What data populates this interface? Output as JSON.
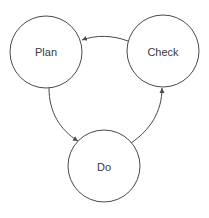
{
  "diagram": {
    "title": "",
    "nodes": [
      {
        "id": "plan",
        "label": "Plan"
      },
      {
        "id": "check",
        "label": "Check"
      },
      {
        "id": "do",
        "label": "Do"
      }
    ],
    "edges": [
      {
        "from": "plan",
        "to": "do"
      },
      {
        "from": "do",
        "to": "check"
      },
      {
        "from": "check",
        "to": "plan"
      }
    ],
    "colors": {
      "stroke": "#4a4a4a",
      "text": "#3a3a3a",
      "background": "#ffffff"
    }
  }
}
